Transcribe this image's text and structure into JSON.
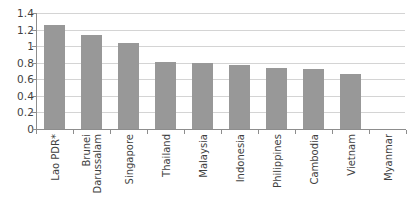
{
  "chart_data": {
    "type": "bar",
    "title": "",
    "subtitle": "",
    "xlabel": "",
    "ylabel": "",
    "ylim": [
      0,
      1.4
    ],
    "grid": true,
    "legend": false,
    "legend_position": "none",
    "orientation": "vertical",
    "bar_color": "#989898",
    "gridline_color": "#d4d4d4",
    "axis_color": "#8d8d8d",
    "categories": [
      "Lao PDR*",
      "Brunei Darussalam",
      "Singapore",
      "Thailand",
      "Malaysia",
      "Indonesia",
      "Philippines",
      "Cambodia",
      "Vietnam",
      "Myanmar"
    ],
    "category_lines": [
      [
        "Lao PDR*"
      ],
      [
        "Brunei",
        "Darussalam"
      ],
      [
        "Singapore"
      ],
      [
        "Thailand"
      ],
      [
        "Malaysia"
      ],
      [
        "Indonesia"
      ],
      [
        "Philippines"
      ],
      [
        "Cambodia"
      ],
      [
        "Vietnam"
      ],
      [
        "Myanmar"
      ]
    ],
    "values": [
      1.25,
      1.13,
      1.04,
      0.81,
      0.8,
      0.77,
      0.74,
      0.72,
      0.67,
      0.0
    ],
    "ytick_labels": [
      "1.4",
      "1.2",
      "1",
      "0.8",
      "0.6",
      "0.4",
      "0.2",
      "0"
    ],
    "ytick_values": [
      1.4,
      1.2,
      1.0,
      0.8,
      0.6,
      0.4,
      0.2,
      0.0
    ],
    "annotations": [
      "*"
    ]
  }
}
